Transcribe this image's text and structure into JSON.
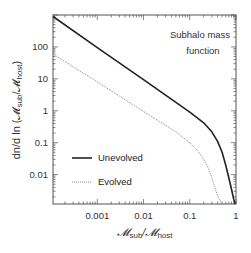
{
  "chart_data": {
    "type": "line",
    "title": "",
    "annotation_lines": [
      "Subhalo mass",
      "function"
    ],
    "xlabel": "𝓜sub/𝓜host",
    "xlabel_parts": {
      "main": "𝓜",
      "sub1": "sub",
      "slash": "/𝓜",
      "sub2": "host"
    },
    "ylabel": "dn/d ln (𝓜sub/𝓜host)",
    "ylabel_parts": {
      "pre": "dn/d ln (𝓜",
      "sub1": "sub",
      "slash": "/𝓜",
      "sub2": "host",
      "post": ")"
    },
    "xscale": "log",
    "yscale": "log",
    "xlim": [
      0.00011,
      1.0
    ],
    "ylim": [
      0.0012,
      1000
    ],
    "xticks": [
      {
        "v": 0.001,
        "label": "0.001"
      },
      {
        "v": 0.01,
        "label": "0.01"
      },
      {
        "v": 0.1,
        "label": "0.1"
      },
      {
        "v": 1,
        "label": "1"
      }
    ],
    "yticks": [
      {
        "v": 100,
        "label": "100"
      },
      {
        "v": 10,
        "label": "10"
      },
      {
        "v": 1,
        "label": "1"
      },
      {
        "v": 0.1,
        "label": "0.1"
      },
      {
        "v": 0.01,
        "label": "0.01"
      }
    ],
    "grid": false,
    "legend_position": "bottom-left",
    "series": [
      {
        "name": "Unevolved",
        "style": "solid",
        "color": "#222222",
        "x": [
          0.00011,
          0.001,
          0.01,
          0.1,
          0.2,
          0.3,
          0.4,
          0.5,
          0.6,
          0.7,
          0.8,
          0.9,
          0.96
        ],
        "y": [
          900,
          95,
          9.5,
          0.9,
          0.42,
          0.22,
          0.11,
          0.05,
          0.02,
          0.008,
          0.0035,
          0.0016,
          0.0012
        ]
      },
      {
        "name": "Evolved",
        "style": "dotted",
        "color": "#888888",
        "x": [
          0.00011,
          0.001,
          0.01,
          0.05,
          0.1,
          0.15,
          0.2,
          0.25,
          0.3,
          0.35,
          0.4,
          0.45,
          0.5
        ],
        "y": [
          60,
          8,
          0.95,
          0.22,
          0.1,
          0.055,
          0.03,
          0.016,
          0.008,
          0.004,
          0.0022,
          0.0015,
          0.0012
        ]
      }
    ]
  }
}
